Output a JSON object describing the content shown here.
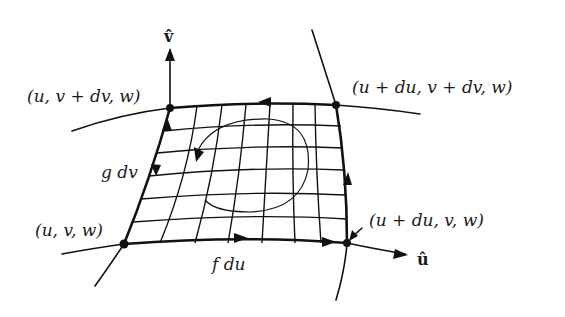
{
  "figure": {
    "axes": {
      "v_hat": "v̂",
      "u_hat": "û"
    },
    "corners": {
      "bottom_left": "(u, v, w)",
      "bottom_right": "(u + du, v, w)",
      "top_left": "(u, v + dv, w)",
      "top_right": "(u + du, v + dv, w)"
    },
    "edges": {
      "bottom": "f du",
      "left": "g dv"
    },
    "grid": {
      "columns": 8,
      "rows": 6
    },
    "colors": {
      "ink": "#111111",
      "background": "#ffffff"
    }
  }
}
